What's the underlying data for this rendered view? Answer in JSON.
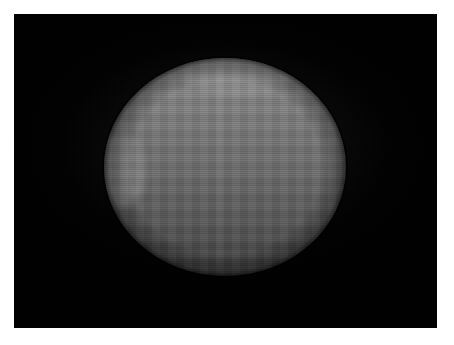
{
  "image": {
    "kind": "photograph",
    "subject": "gray illuminated spherical disk on a black field",
    "frame_border_color": "#ffffff",
    "field_background_color": "#010101",
    "canvas_width_px": 454,
    "canvas_height_px": 345,
    "field": {
      "left_px": 14,
      "top_px": 14,
      "width_px": 423,
      "height_px": 314
    },
    "disk": {
      "center_x_px": 225,
      "center_y_px": 167,
      "radius_x_px": 121,
      "radius_y_px": 109,
      "top_color": "#8a8a8a",
      "mid_color": "#6a6a6a",
      "bottom_color": "#383838",
      "edge": "soft, slightly irregular limb",
      "texture": "horizontal scan lines with blocky compression artifacts"
    }
  },
  "overlay": {
    "title": "",
    "caption": "",
    "labels": []
  }
}
